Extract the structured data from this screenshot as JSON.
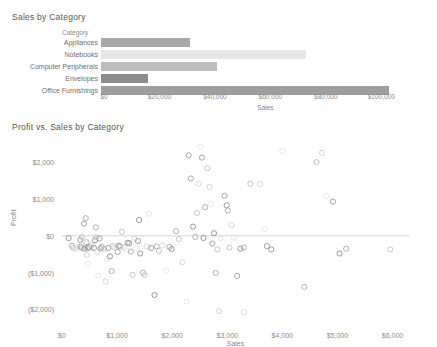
{
  "bar_chart": {
    "title": "Sales by Category",
    "column_header": "Category",
    "x_axis_title": "Sales",
    "ticks": [
      "$0",
      "$20,000",
      "$40,000",
      "$60,000",
      "$80,000",
      "$100,000"
    ]
  },
  "scatter_chart": {
    "title": "Profit vs. Sales by Category",
    "x_axis_title": "Sales",
    "y_axis_title": "Profit",
    "x_ticks": [
      "$0",
      "$1,000",
      "$2,000",
      "$3,000",
      "$4,000",
      "$5,000",
      "$6,000"
    ],
    "y_ticks": [
      "$2,000",
      "$1,000",
      "$0",
      "($1,000)",
      "($2,000)"
    ]
  },
  "chart_data": [
    {
      "type": "bar",
      "orientation": "horizontal",
      "title": "Sales by Category",
      "xlabel": "Sales",
      "ylabel": "Category",
      "categories": [
        "Appliances",
        "Notebooks",
        "Computer Peripherals",
        "Envelopes",
        "Office Furnishings"
      ],
      "values": [
        32000,
        74000,
        42000,
        17000,
        104000
      ],
      "colors": [
        "#a8a8a8",
        "#e6e6e6",
        "#bdbdbd",
        "#8c8c8c",
        "#9e9e9e"
      ],
      "xlim": [
        0,
        110000
      ],
      "xticks": [
        0,
        20000,
        40000,
        60000,
        80000,
        100000
      ],
      "grid": false,
      "legend": "none"
    },
    {
      "type": "scatter",
      "title": "Profit vs. Sales by Category",
      "xlabel": "Sales",
      "ylabel": "Profit",
      "xlim": [
        0,
        6300
      ],
      "ylim": [
        -2400,
        2500
      ],
      "xticks": [
        0,
        1000,
        2000,
        3000,
        4000,
        5000,
        6000
      ],
      "yticks": [
        -2000,
        -1000,
        0,
        1000,
        2000
      ],
      "grid": false,
      "legend": "none",
      "marker": "open-circle",
      "points": [
        [
          120,
          -60
        ],
        [
          180,
          -270
        ],
        [
          205,
          -330
        ],
        [
          245,
          -360
        ],
        [
          300,
          -290
        ],
        [
          330,
          -110
        ],
        [
          340,
          -300
        ],
        [
          355,
          -330
        ],
        [
          360,
          -40
        ],
        [
          370,
          -320
        ],
        [
          380,
          -270
        ],
        [
          400,
          330
        ],
        [
          410,
          -350
        ],
        [
          430,
          480
        ],
        [
          440,
          -170
        ],
        [
          455,
          -520
        ],
        [
          465,
          -760
        ],
        [
          470,
          -330
        ],
        [
          480,
          -300
        ],
        [
          500,
          -310
        ],
        [
          520,
          -250
        ],
        [
          540,
          -320
        ],
        [
          560,
          -260
        ],
        [
          580,
          -330
        ],
        [
          600,
          -120
        ],
        [
          615,
          230
        ],
        [
          620,
          -40
        ],
        [
          640,
          -430
        ],
        [
          660,
          -1080
        ],
        [
          680,
          -70
        ],
        [
          700,
          -340
        ],
        [
          720,
          -300
        ],
        [
          760,
          -350
        ],
        [
          790,
          -1240
        ],
        [
          810,
          -630
        ],
        [
          840,
          -330
        ],
        [
          870,
          -560
        ],
        [
          900,
          -960
        ],
        [
          920,
          -280
        ],
        [
          950,
          -320
        ],
        [
          980,
          -300
        ],
        [
          1010,
          -440
        ],
        [
          1030,
          -270
        ],
        [
          1060,
          -290
        ],
        [
          1090,
          110
        ],
        [
          1130,
          -310
        ],
        [
          1160,
          -380
        ],
        [
          1190,
          -190
        ],
        [
          1220,
          -200
        ],
        [
          1250,
          -430
        ],
        [
          1280,
          -1060
        ],
        [
          1320,
          -80
        ],
        [
          1350,
          -330
        ],
        [
          1380,
          -140
        ],
        [
          1420,
          -480
        ],
        [
          1470,
          -1000
        ],
        [
          1500,
          -1060
        ],
        [
          1540,
          -290
        ],
        [
          1580,
          600
        ],
        [
          1620,
          -330
        ],
        [
          1680,
          -1610
        ],
        [
          1720,
          -290
        ],
        [
          1760,
          -410
        ],
        [
          1820,
          -260
        ],
        [
          1890,
          -950
        ],
        [
          1950,
          -300
        ],
        [
          1990,
          -360
        ],
        [
          2070,
          130
        ],
        [
          2120,
          -90
        ],
        [
          2190,
          -720
        ],
        [
          2260,
          -1790
        ],
        [
          2340,
          1560
        ],
        [
          2380,
          250
        ],
        [
          2420,
          -30
        ],
        [
          2450,
          620
        ],
        [
          2480,
          1420
        ],
        [
          2510,
          2420
        ],
        [
          2540,
          2130
        ],
        [
          2570,
          -60
        ],
        [
          2600,
          780
        ],
        [
          2640,
          1840
        ],
        [
          2680,
          1330
        ],
        [
          2700,
          880
        ],
        [
          2730,
          -210
        ],
        [
          2760,
          70
        ],
        [
          2790,
          -1010
        ],
        [
          2820,
          -370
        ],
        [
          2850,
          -2050
        ],
        [
          2880,
          -70
        ],
        [
          2950,
          1090
        ],
        [
          2990,
          830
        ],
        [
          3010,
          690
        ],
        [
          3040,
          -320
        ],
        [
          3080,
          290
        ],
        [
          3120,
          -50
        ],
        [
          3180,
          -1090
        ],
        [
          3240,
          -350
        ],
        [
          3300,
          -320
        ],
        [
          3420,
          1420
        ],
        [
          3600,
          1410
        ],
        [
          3680,
          190
        ],
        [
          3720,
          -280
        ],
        [
          3800,
          -370
        ],
        [
          4400,
          -1390
        ],
        [
          4620,
          2010
        ],
        [
          4720,
          2260
        ],
        [
          4800,
          1080
        ],
        [
          4920,
          930
        ],
        [
          5040,
          -480
        ],
        [
          5160,
          -350
        ],
        [
          5960,
          -370
        ],
        [
          3300,
          -2080
        ],
        [
          4000,
          2310
        ],
        [
          2300,
          2190
        ],
        [
          1400,
          430
        ]
      ]
    }
  ]
}
